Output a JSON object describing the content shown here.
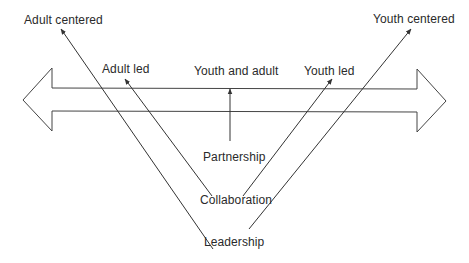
{
  "diagram": {
    "type": "youth-adult-continuum",
    "colors": {
      "line": "#333333",
      "text": "#2a2a2a",
      "background": "#ffffff"
    },
    "double_arrow": {
      "left_end": "adult",
      "right_end": "youth"
    },
    "labels": {
      "adult_centered": "Adult centered",
      "youth_centered": "Youth centered",
      "adult_led": "Adult led",
      "youth_and_adult": "Youth and adult",
      "youth_led": "Youth led",
      "partnership": "Partnership",
      "collaboration": "Collaboration",
      "leadership": "Leadership"
    },
    "edges": [
      {
        "from": "leadership",
        "to": "adult_centered"
      },
      {
        "from": "leadership",
        "to": "youth_centered"
      },
      {
        "from": "collaboration",
        "to": "adult_led"
      },
      {
        "from": "collaboration",
        "to": "youth_led"
      },
      {
        "from": "partnership",
        "to": "youth_and_adult"
      }
    ]
  }
}
